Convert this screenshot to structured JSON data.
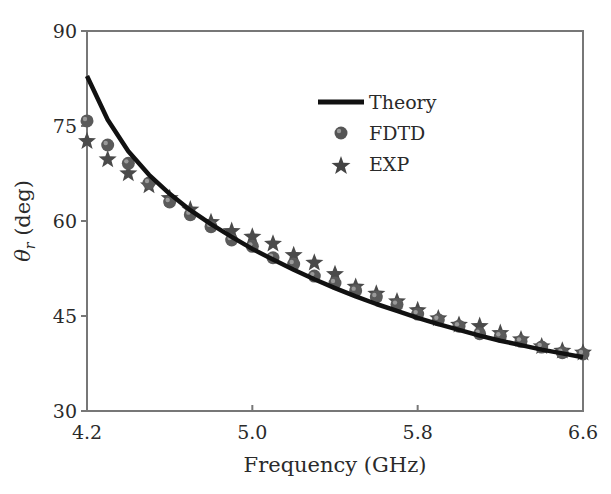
{
  "chart_data": {
    "type": "line",
    "title": "",
    "xlabel": "Frequency (GHz)",
    "ylabel": "θr (deg)",
    "ylabel_symbol": "θ",
    "ylabel_subscript": "r",
    "ylabel_unit": " (deg)",
    "xlim": [
      4.2,
      6.6
    ],
    "ylim": [
      30,
      90
    ],
    "xticks": [
      "4.2",
      "5.0",
      "5.8",
      "6.6"
    ],
    "yticks": [
      "30",
      "45",
      "60",
      "75",
      "90"
    ],
    "grid": false,
    "legend_position": "upper right (inside)",
    "x": [
      4.2,
      4.3,
      4.4,
      4.5,
      4.6,
      4.7,
      4.8,
      4.9,
      5.0,
      5.1,
      5.2,
      5.3,
      5.4,
      5.5,
      5.6,
      5.7,
      5.8,
      5.9,
      6.0,
      6.1,
      6.2,
      6.3,
      6.4,
      6.5,
      6.6
    ],
    "series": [
      {
        "name": "Theory",
        "style": "solid line",
        "color": "#111111",
        "values": [
          82.9,
          76.0,
          71.0,
          67.3,
          64.3,
          61.7,
          59.5,
          57.5,
          55.6,
          53.9,
          52.3,
          50.8,
          49.4,
          48.1,
          46.9,
          45.8,
          44.7,
          43.7,
          42.8,
          41.9,
          41.1,
          40.4,
          39.7,
          39.1,
          38.5
        ]
      },
      {
        "name": "FDTD",
        "style": "sphere marker",
        "color": "#5a5a5a",
        "values": [
          75.8,
          72.0,
          69.1,
          66.0,
          63.0,
          61.0,
          59.1,
          57.0,
          56.0,
          54.2,
          53.2,
          51.3,
          50.2,
          49.0,
          48.0,
          46.8,
          45.3,
          44.4,
          43.4,
          42.2,
          41.8,
          41.0,
          40.1,
          39.2,
          39.0
        ]
      },
      {
        "name": "EXP",
        "style": "star marker",
        "color": "#4a4a4a",
        "values": [
          72.6,
          69.7,
          67.5,
          65.6,
          63.6,
          61.8,
          59.8,
          58.4,
          57.5,
          56.4,
          54.6,
          53.4,
          51.6,
          49.6,
          48.5,
          47.3,
          45.9,
          44.6,
          43.6,
          43.4,
          42.3,
          41.3,
          40.2,
          39.5,
          39.2
        ]
      }
    ]
  },
  "legend": {
    "items": [
      {
        "label": "Theory"
      },
      {
        "label": "FDTD"
      },
      {
        "label": "EXP"
      }
    ]
  },
  "axes": {
    "xlabel": "Frequency (GHz)",
    "ylabel_symbol": "θ",
    "ylabel_subscript": "r",
    "ylabel_unit": " (deg)",
    "xticks": [
      "4.2",
      "5.0",
      "5.8",
      "6.6"
    ],
    "yticks": [
      "30",
      "45",
      "60",
      "75",
      "90"
    ]
  }
}
